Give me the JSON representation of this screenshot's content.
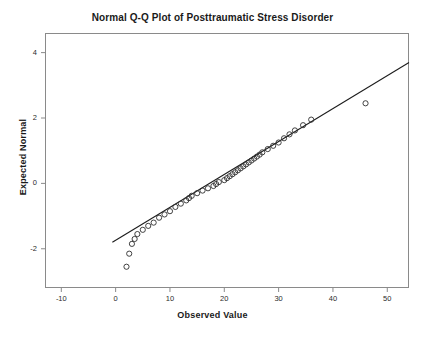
{
  "chart_data": {
    "type": "scatter",
    "title": "Normal Q-Q Plot of Posttraumatic Stress Disorder",
    "xlabel": "Observed Value",
    "ylabel": "Expected Normal",
    "xlim": [
      -13,
      54
    ],
    "ylim": [
      -3.2,
      4.6
    ],
    "xticks": [
      -10,
      0,
      10,
      20,
      30,
      40,
      50
    ],
    "xtick_labels": [
      "-10",
      "0",
      "10",
      "20",
      "30",
      "40",
      "50"
    ],
    "yticks": [
      -2,
      0,
      2,
      4
    ],
    "ytick_labels": [
      "-2",
      "0",
      "2",
      "4"
    ],
    "grid": false,
    "legend": null,
    "series": [
      {
        "name": "Q-Q points",
        "marker": "open-circle",
        "x": [
          2.0,
          2.5,
          3.0,
          3.5,
          4.0,
          5.0,
          6.0,
          7.0,
          8.0,
          9.0,
          10.0,
          11.0,
          12.0,
          13.0,
          13.5,
          14.0,
          15.0,
          16.0,
          17.0,
          18.0,
          18.5,
          19.0,
          20.0,
          20.5,
          21.0,
          21.5,
          22.0,
          22.5,
          23.0,
          23.5,
          24.0,
          24.5,
          25.0,
          25.5,
          26.0,
          26.5,
          27.0,
          28.0,
          29.0,
          30.0,
          31.0,
          32.0,
          33.0,
          34.5,
          36.0,
          46.0
        ],
        "y": [
          -2.55,
          -2.15,
          -1.85,
          -1.7,
          -1.55,
          -1.42,
          -1.3,
          -1.2,
          -1.05,
          -0.95,
          -0.85,
          -0.72,
          -0.62,
          -0.52,
          -0.45,
          -0.38,
          -0.3,
          -0.22,
          -0.15,
          -0.08,
          -0.02,
          0.04,
          0.1,
          0.16,
          0.22,
          0.28,
          0.34,
          0.4,
          0.46,
          0.52,
          0.58,
          0.64,
          0.7,
          0.76,
          0.82,
          0.88,
          0.95,
          1.05,
          1.15,
          1.25,
          1.38,
          1.5,
          1.62,
          1.78,
          1.95,
          2.45
        ]
      }
    ],
    "reference_line": {
      "name": "normality-reference-line",
      "x_start": -0.6,
      "y_start": -1.8,
      "x_end": 57.5,
      "y_end": 4.05
    }
  }
}
